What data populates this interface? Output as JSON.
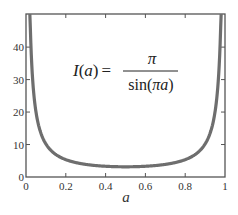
{
  "chart_data": {
    "type": "line",
    "title": "",
    "formula": {
      "lhs": "I(a)",
      "equals": "=",
      "numerator": "π",
      "denominator": "sin(πa)"
    },
    "xlabel": "a",
    "ylabel": "",
    "xlim": [
      0,
      1
    ],
    "ylim": [
      0,
      50
    ],
    "x_ticks": [
      "0",
      "0.2",
      "0.4",
      "0.6",
      "0.8",
      "1"
    ],
    "y_ticks": [
      "0",
      "10",
      "20",
      "30",
      "40"
    ],
    "grid": false,
    "legend": null,
    "series": [
      {
        "name": "I(a) = π / sin(πa)",
        "color": "#6e6e6e",
        "x": [
          0.02,
          0.03,
          0.05,
          0.08,
          0.1,
          0.15,
          0.2,
          0.25,
          0.3,
          0.4,
          0.5,
          0.6,
          0.7,
          0.75,
          0.8,
          0.85,
          0.9,
          0.92,
          0.95,
          0.97,
          0.98
        ],
        "values": [
          50.0,
          33.4,
          20.1,
          12.6,
          10.2,
          7.0,
          5.3,
          4.4,
          3.9,
          3.3,
          3.14,
          3.3,
          3.9,
          4.4,
          5.3,
          7.0,
          10.2,
          12.6,
          20.1,
          33.4,
          50.0
        ]
      }
    ]
  },
  "colors": {
    "axis": "#555555",
    "curve": "#6e6e6e",
    "background": "#ffffff"
  }
}
